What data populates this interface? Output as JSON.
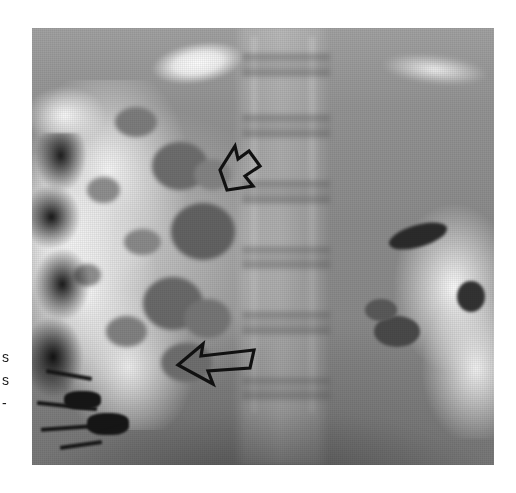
{
  "page": {
    "background_color": "#ffffff",
    "width": 516,
    "height": 493
  },
  "margin_text": {
    "lines": [
      "s",
      "s",
      "-"
    ],
    "color": "#1b1b1b"
  },
  "figure": {
    "type": "radiograph",
    "modality_label": "barium contrast abdominal radiograph",
    "frame": {
      "left": 32,
      "top": 28,
      "width": 462,
      "height": 437,
      "base_color": "#8d8d8d"
    },
    "regions": [
      {
        "name": "lumbar-spine",
        "description": "central vertical column with horizontal vertebral body bands"
      },
      {
        "name": "barium-filled-bowel-left",
        "description": "bright flocculated barium mass, left abdomen"
      },
      {
        "name": "gas-filled-segment-left-edge",
        "description": "dark irregular gas column along left margin"
      },
      {
        "name": "barium-filled-bowel-right",
        "description": "bright bowel loops with dark gas pockets, right abdomen"
      },
      {
        "name": "top-bright-structure",
        "description": "elongated bright band across upper field"
      }
    ],
    "annotations": [
      {
        "name": "upper-arrow",
        "label": "upper arrow",
        "direction": "down-left",
        "x": 205,
        "y": 140,
        "width": 62,
        "height": 58,
        "stroke_color": "#111111",
        "stroke_width": 3,
        "fill": "none"
      },
      {
        "name": "lower-arrow",
        "label": "lower arrow",
        "direction": "left",
        "x": 170,
        "y": 334,
        "width": 86,
        "height": 50,
        "stroke_color": "#111111",
        "stroke_width": 3,
        "fill": "none"
      }
    ],
    "colors": {
      "film_light": "#fbfbfb",
      "film_mid": "#8d8d8d",
      "film_dark": "#141414",
      "annotation": "#111111"
    }
  }
}
